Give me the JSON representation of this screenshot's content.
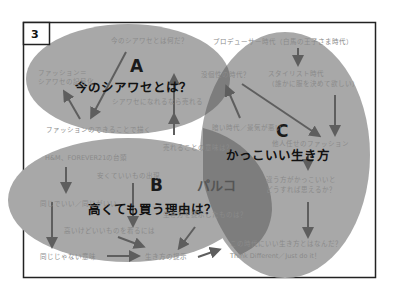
{
  "panel": {
    "number": "3"
  },
  "colors": {
    "ellipse_fill": "#a8a8a8",
    "overlap_fill": "#7d7d7d",
    "arrow": "#5e5e5e",
    "frame": "#222222",
    "small_text": "#8a8a8a",
    "big_text": "#111111"
  },
  "circles": {
    "a": {
      "letter": "A",
      "title": "今のシアワセとは？",
      "notes": [
        "今のシアワセとは何だ？",
        "ファッション＝",
        "シアワセの記号化",
        "シアワセになれるなら売れる",
        "ファッションのできることで描く"
      ]
    },
    "b": {
      "letter": "B",
      "title": "高くても買う理由は？",
      "notes": [
        "H&M、FOREVER21の台頭",
        "安くていいもの出現",
        "同じでいい／同じがいい",
        "高いけどいいものを着るには",
        "同じじゃない意味",
        "生き方の提示"
      ]
    },
    "c": {
      "letter": "C",
      "title": "かっこいい生き方",
      "notes": [
        "プロデューサー時代（白馬の王子さま時代）",
        "スタイリスト時代",
        "（誰かに服を決めて欲しい）",
        "他人任せのファッション",
        "違う方がかっこいいと",
        "どうすれば思えるか？",
        "この時代にいい生き方とはなんだ？",
        "Think Different／Just do it！"
      ]
    },
    "overlaps": {
      "ac": "没個性の時代？",
      "ac_low": "暗い時代／景気が悪い",
      "ab": "売れることの意味は？",
      "bc_name": "パルコ",
      "bc": "生き方を提示したものは？"
    }
  }
}
